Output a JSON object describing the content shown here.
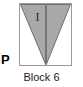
{
  "figure": {
    "caption": "Block 6",
    "panel_letter": "P",
    "colors": {
      "triangle_fill": "#a8a8a8",
      "triangle_fill_right": "#a9a9a9",
      "outline": "#6e6e6e",
      "square_border": "#9a9a9a",
      "background": "#ffffff",
      "text": "#1a1a1a",
      "label_text": "#2b2b2b"
    },
    "square": {
      "x": 19,
      "y": 3,
      "width": 53,
      "height": 63
    },
    "regions": [
      {
        "name": "left-half-triangle",
        "label": "I",
        "fill": "#a8a8a8",
        "points": "1,1 26,1 26,61 1,1"
      },
      {
        "name": "right-half-triangle",
        "label": "",
        "fill": "#a9a9a9",
        "points": "27,1 51,1 27,61 27,1"
      }
    ],
    "divider": {
      "name": "vertical-midline",
      "x1": 26.5,
      "y1": 1,
      "x2": 26.5,
      "y2": 61
    }
  }
}
